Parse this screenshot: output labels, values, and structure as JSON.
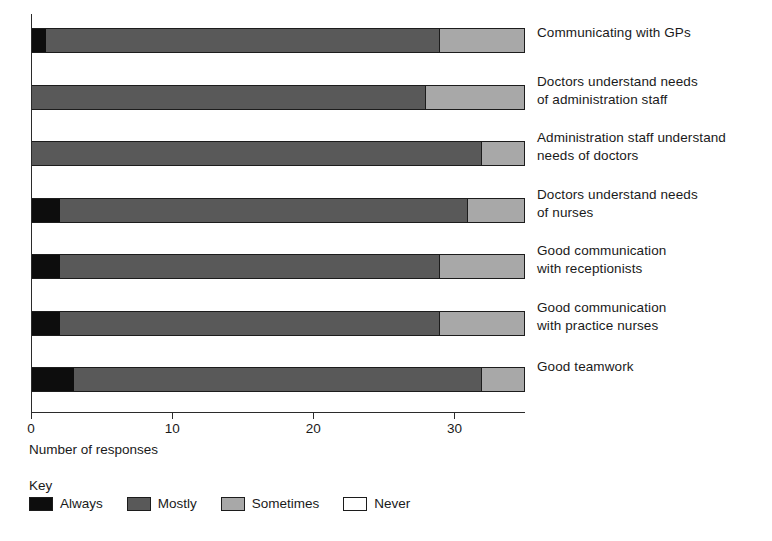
{
  "chart_data": {
    "type": "bar",
    "subtype": "horizontal-stacked",
    "title": "",
    "xlabel": "Number of responses",
    "ylabel": "",
    "xlim": [
      0,
      35
    ],
    "xticks": [
      0,
      10,
      20,
      30
    ],
    "xtick_labels": [
      "0",
      "10",
      "20",
      "30"
    ],
    "grid": false,
    "legend_title": "Key",
    "legend_position": "bottom-left",
    "total_per_category": 35,
    "categories": [
      "Communicating with GPs",
      "Doctors understand needs\nof administration staff",
      "Administration staff understand\nneeds of doctors",
      "Doctors understand needs\nof nurses",
      "Good communication\nwith receptionists",
      "Good communication\nwith practice nurses",
      "Good teamwork"
    ],
    "series": [
      {
        "name": "Always",
        "color": "#0d0d0d",
        "values": [
          1,
          0,
          0,
          2,
          2,
          2,
          3
        ]
      },
      {
        "name": "Mostly",
        "color": "#595959",
        "values": [
          28,
          28,
          32,
          29,
          27,
          27,
          29
        ]
      },
      {
        "name": "Sometimes",
        "color": "#a8a8a8",
        "values": [
          6,
          7,
          3,
          4,
          6,
          6,
          3
        ]
      },
      {
        "name": "Never",
        "color": "#ffffff",
        "values": [
          0,
          0,
          0,
          0,
          0,
          0,
          0
        ]
      }
    ]
  },
  "axis": {
    "x_title": "Number of responses",
    "ticks": [
      "0",
      "10",
      "20",
      "30"
    ]
  },
  "legend": {
    "title": "Key",
    "items": [
      {
        "label": "Always",
        "color": "#0d0d0d"
      },
      {
        "label": "Mostly",
        "color": "#595959"
      },
      {
        "label": "Sometimes",
        "color": "#a8a8a8"
      },
      {
        "label": "Never",
        "color": "#ffffff"
      }
    ]
  },
  "colors": {
    "always": "#0d0d0d",
    "mostly": "#595959",
    "sometimes": "#a8a8a8",
    "never": "#ffffff",
    "outline": "#1c1c1c",
    "text": "#1a1a1a",
    "background": "#ffffff"
  }
}
